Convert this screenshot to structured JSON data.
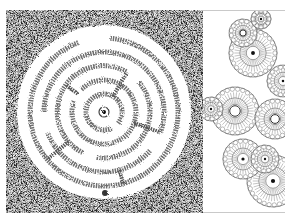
{
  "spread": {
    "left_page": {
      "subject": "circular maze on stippled background",
      "background_color": "#8a8a8a",
      "paper_color": "#ffffff",
      "maze": {
        "center": [
          98,
          102
        ],
        "outer_radius": 87,
        "rings": 5,
        "start_marker": "center-dot",
        "exit_marker": "bottom-dot"
      }
    },
    "right_page": {
      "subject": "cluster of circular flower rosettes (mandala)",
      "line_color": "#555555",
      "flowers": [
        {
          "cx": 50,
          "cy": 42,
          "r": 24
        },
        {
          "cx": 32,
          "cy": 100,
          "r": 24
        },
        {
          "cx": 70,
          "cy": 170,
          "r": 26
        },
        {
          "cx": 72,
          "cy": 108,
          "r": 20
        },
        {
          "cx": 40,
          "cy": 22,
          "r": 14
        },
        {
          "cx": 8,
          "cy": 98,
          "r": 12
        },
        {
          "cx": 62,
          "cy": 148,
          "r": 14
        },
        {
          "cx": 80,
          "cy": 70,
          "r": 16
        },
        {
          "cx": 40,
          "cy": 148,
          "r": 20
        },
        {
          "cx": 58,
          "cy": 8,
          "r": 10
        }
      ]
    }
  }
}
